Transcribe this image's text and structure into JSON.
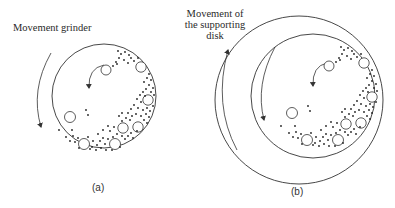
{
  "panel_a": {
    "label": "Movement grinder",
    "caption": "(a)"
  },
  "panel_b": {
    "label_line1": "Movement of",
    "label_line2": "the supporting",
    "label_line3": "disk",
    "caption": "(b)"
  },
  "colors": {
    "stroke": "#333333",
    "background": "#ffffff"
  }
}
